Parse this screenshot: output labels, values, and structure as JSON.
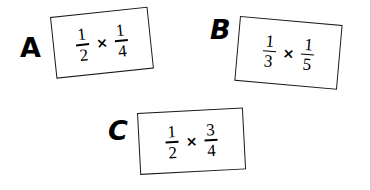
{
  "page": {
    "background_color": "#ffffff",
    "ink_color": "#000000",
    "kind": "multiple-choice-fraction-expressions"
  },
  "options": [
    {
      "letter": "A",
      "expression": {
        "left_fraction": {
          "numerator": "1",
          "denominator": "2"
        },
        "operator": "×",
        "right_fraction": {
          "numerator": "1",
          "denominator": "4"
        }
      }
    },
    {
      "letter": "B",
      "expression": {
        "left_fraction": {
          "numerator": "1",
          "denominator": "3"
        },
        "operator": "×",
        "right_fraction": {
          "numerator": "1",
          "denominator": "5"
        }
      }
    },
    {
      "letter": "C",
      "expression": {
        "left_fraction": {
          "numerator": "1",
          "denominator": "2"
        },
        "operator": "×",
        "right_fraction": {
          "numerator": "3",
          "denominator": "4"
        }
      }
    }
  ]
}
